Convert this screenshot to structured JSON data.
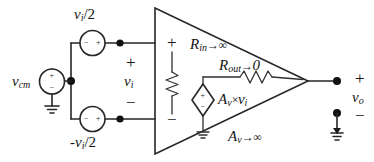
{
  "figure": {
    "type": "circuit-diagram"
  },
  "labels": {
    "vi_half_top": {
      "base": "v",
      "sub": "i",
      "tail": "/2"
    },
    "vi_half_bottom": {
      "lead": "-",
      "base": "v",
      "sub": "i",
      "tail": "/2"
    },
    "vcm": {
      "base": "v",
      "sub": "cm"
    },
    "vi": {
      "base": "v",
      "sub": "i"
    },
    "vo": {
      "base": "v",
      "sub": "o"
    },
    "rin": {
      "base": "R",
      "sub": "in",
      "arrow": "→",
      "value": "∞"
    },
    "rout": {
      "base": "R",
      "sub": "out",
      "arrow": "→",
      "value": "0"
    },
    "av_gain": {
      "base": "A",
      "sub": "v",
      "times": "×",
      "operand_base": "v",
      "operand_sub": "i"
    },
    "av_limit": {
      "base": "A",
      "sub": "v",
      "arrow": "→",
      "value": "∞"
    }
  },
  "signs": {
    "plus": "+",
    "minus": "−",
    "plus_small": "+",
    "minus_small": "−"
  },
  "terminals": {
    "opamp_in_plus": "+",
    "opamp_in_minus": "−",
    "vi_plus": "+",
    "vi_minus": "−",
    "vo_plus": "+",
    "vo_minus": "−",
    "rin_plus": "+",
    "rin_minus": "−"
  },
  "components": {
    "source_vi_top": "independent-voltage-source",
    "source_vi_bottom": "independent-voltage-source",
    "source_vcm": "independent-voltage-source",
    "source_dependent": "dependent-voltage-source",
    "resistor_rin": "resistor",
    "resistor_rout": "resistor",
    "opamp": "operational-amplifier-triangle",
    "ground_vcm": "ground-symbol",
    "ground_dependent": "ground-symbol",
    "ground_output": "ground-symbol"
  },
  "colors": {
    "ink": "#262626",
    "background": "#ffffff",
    "node": "#111111"
  }
}
